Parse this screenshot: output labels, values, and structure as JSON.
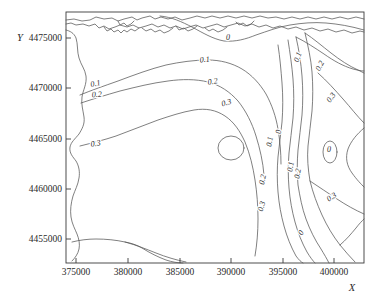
{
  "chart_data": {
    "type": "line",
    "subtype": "contour-map",
    "title": "",
    "xlabel": "X",
    "ylabel": "Y",
    "xlim": [
      373000,
      403500
    ],
    "ylim": [
      4452800,
      4477200
    ],
    "xticks": [
      375000,
      380000,
      385000,
      390000,
      395000,
      400000
    ],
    "yticks": [
      4455000,
      4460000,
      4465000,
      4470000,
      4475000
    ],
    "xticklabels": [
      "375000",
      "380000",
      "385000",
      "390000",
      "395000",
      "400000"
    ],
    "yticklabels": [
      "4455000",
      "4460000",
      "4465000",
      "4470000",
      "4475000"
    ],
    "grid": false,
    "legend": false,
    "contour_levels": [
      0,
      0.1,
      0.2,
      0.3
    ],
    "contour_labels": [
      {
        "text": "0",
        "x": 228,
        "y": 40,
        "rot": 0
      },
      {
        "text": "0.1",
        "x": 205,
        "y": 62,
        "rot": -6
      },
      {
        "text": "0.2",
        "x": 213,
        "y": 84,
        "rot": -8
      },
      {
        "text": "0.3",
        "x": 227,
        "y": 105,
        "rot": -16
      },
      {
        "text": "0.1",
        "x": 96,
        "y": 86,
        "rot": -12
      },
      {
        "text": "0.2",
        "x": 97,
        "y": 97,
        "rot": -4
      },
      {
        "text": "0.3",
        "x": 96,
        "y": 146,
        "rot": -8
      },
      {
        "text": "0.1",
        "x": 300,
        "y": 58,
        "rot": -68
      },
      {
        "text": "0.2",
        "x": 322,
        "y": 67,
        "rot": -62
      },
      {
        "text": "0.3",
        "x": 333,
        "y": 99,
        "rot": -52
      },
      {
        "text": "0",
        "x": 281,
        "y": 132,
        "rot": -84
      },
      {
        "text": "0.1",
        "x": 272,
        "y": 142,
        "rot": -80
      },
      {
        "text": "0.2",
        "x": 265,
        "y": 180,
        "rot": -78
      },
      {
        "text": "0.3",
        "x": 264,
        "y": 207,
        "rot": -74
      },
      {
        "text": "0.1",
        "x": 293,
        "y": 167,
        "rot": -82
      },
      {
        "text": "0.2",
        "x": 300,
        "y": 174,
        "rot": -80
      },
      {
        "text": "0",
        "x": 303,
        "y": 234,
        "rot": -58
      },
      {
        "text": "0.3",
        "x": 333,
        "y": 199,
        "rot": -34
      },
      {
        "text": "0",
        "x": 329,
        "y": 152,
        "rot": 0
      }
    ],
    "closed_features": [
      {
        "name": "interior-circle",
        "cx": 231,
        "cy": 148,
        "rx": 13,
        "ry": 12,
        "level": 0.3
      },
      {
        "name": "right-zero-loop",
        "cx": 330,
        "cy": 152,
        "rx": 7,
        "ry": 11,
        "level": 0
      }
    ]
  },
  "axes": {
    "x_title": "X",
    "y_title": "Y"
  }
}
